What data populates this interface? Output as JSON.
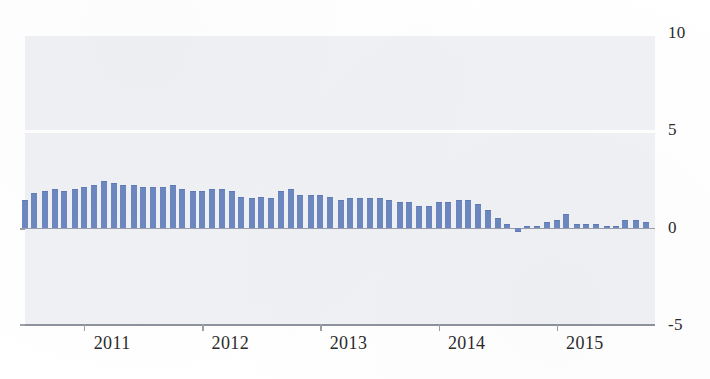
{
  "chart_data": {
    "type": "bar",
    "title": "",
    "subtitle": "",
    "xlabel": "",
    "ylabel": "",
    "ylim": [
      -5,
      10
    ],
    "grid": true,
    "legend": null,
    "y_ticks": [
      10,
      5,
      0,
      -5
    ],
    "y_tick_labels": [
      "10",
      "5",
      "0",
      "-5"
    ],
    "x_tick_labels": [
      "2011",
      "2012",
      "2013",
      "2014",
      "2015"
    ],
    "x_tick_positions": [
      2011,
      2012,
      2013,
      2014,
      2015
    ],
    "x_range": [
      2010.5,
      2015.83
    ],
    "bar_color": "#6d88c0",
    "plot_background": "#f0f1f4",
    "axis_color": "#8d929c",
    "gridline_color": "#ffffff",
    "n_bars": 64,
    "x": [
      2010.5,
      2010.58,
      2010.67,
      2010.75,
      2010.83,
      2010.92,
      2011.0,
      2011.08,
      2011.17,
      2011.25,
      2011.33,
      2011.42,
      2011.5,
      2011.58,
      2011.67,
      2011.75,
      2011.83,
      2011.92,
      2012.0,
      2012.08,
      2012.17,
      2012.25,
      2012.33,
      2012.42,
      2012.5,
      2012.58,
      2012.67,
      2012.75,
      2012.83,
      2012.92,
      2013.0,
      2013.08,
      2013.17,
      2013.25,
      2013.33,
      2013.42,
      2013.5,
      2013.58,
      2013.67,
      2013.75,
      2013.83,
      2013.92,
      2014.0,
      2014.08,
      2014.17,
      2014.25,
      2014.33,
      2014.42,
      2014.5,
      2014.58,
      2014.67,
      2014.75,
      2014.83,
      2014.92,
      2015.0,
      2015.08,
      2015.17,
      2015.25,
      2015.33,
      2015.42,
      2015.5,
      2015.58,
      2015.67,
      2015.75
    ],
    "values": [
      1.4,
      1.8,
      1.9,
      2.0,
      1.9,
      2.0,
      2.1,
      2.2,
      2.4,
      2.3,
      2.2,
      2.2,
      2.1,
      2.1,
      2.1,
      2.2,
      2.0,
      1.9,
      1.9,
      2.0,
      2.0,
      1.9,
      1.6,
      1.5,
      1.6,
      1.5,
      1.9,
      2.0,
      1.7,
      1.7,
      1.7,
      1.6,
      1.4,
      1.5,
      1.5,
      1.5,
      1.5,
      1.4,
      1.3,
      1.3,
      1.1,
      1.1,
      1.3,
      1.3,
      1.4,
      1.4,
      1.2,
      0.9,
      0.5,
      0.2,
      -0.2,
      0.1,
      0.1,
      0.3,
      0.4,
      0.7,
      0.2,
      0.2,
      0.2,
      0.1,
      0.0,
      0.4,
      0.4,
      0.3
    ]
  },
  "chart_meta": {
    "bar_width_px": 6,
    "bar_pitch_px": 9.85
  }
}
